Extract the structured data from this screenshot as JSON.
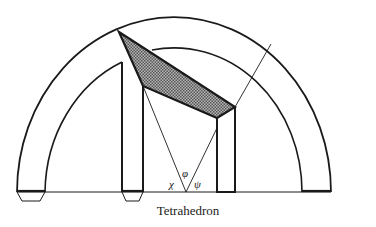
{
  "figure": {
    "caption": "Tetrahedron",
    "angle_labels": {
      "chi": "χ",
      "phi": "φ",
      "psi": "ψ"
    },
    "colors": {
      "stroke": "#1a1a1a",
      "shade": "#8a8a8a",
      "background": "#ffffff"
    }
  }
}
